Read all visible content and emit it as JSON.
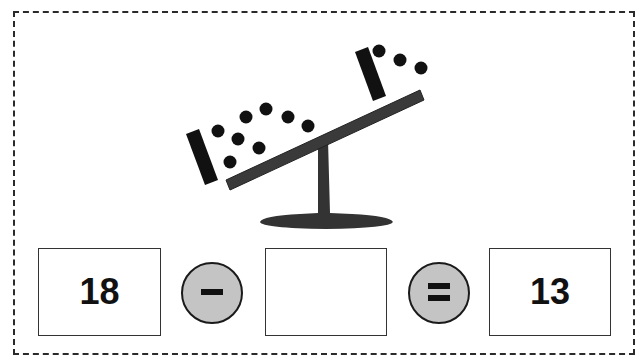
{
  "worksheet": {
    "seesaw": {
      "left_side": {
        "tens_bars": 1,
        "ones_dots": 8,
        "represents": 18
      },
      "right_side": {
        "tens_bars": 1,
        "ones_dots": 3,
        "represents": 13
      },
      "beam_color": "#3a3a3a",
      "stand_color": "#333333"
    },
    "equation": {
      "first_value": "18",
      "operator_1": "−",
      "operator_1_name": "minus",
      "answer_value": "",
      "operator_2": "=",
      "operator_2_name": "equals",
      "result_value": "13"
    },
    "colors": {
      "border": "#2a2a2a",
      "operator_fill": "#c4c4c4",
      "ink": "#111111"
    }
  }
}
